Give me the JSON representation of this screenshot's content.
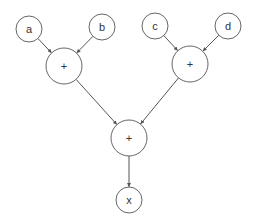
{
  "diagram": {
    "type": "computation-graph",
    "nodes": [
      {
        "id": "a",
        "label": "a",
        "cx": 29,
        "cy": 29,
        "r": 13
      },
      {
        "id": "b",
        "label": "b",
        "cx": 102,
        "cy": 27,
        "r": 13
      },
      {
        "id": "c",
        "label": "c",
        "cx": 155,
        "cy": 26,
        "r": 13
      },
      {
        "id": "d",
        "label": "d",
        "cx": 228,
        "cy": 26,
        "r": 13
      },
      {
        "id": "plus1",
        "label": "+",
        "cx": 64,
        "cy": 66,
        "r": 18
      },
      {
        "id": "plus2",
        "label": "+",
        "cx": 190,
        "cy": 64,
        "r": 18
      },
      {
        "id": "plus3",
        "label": "+",
        "cx": 129,
        "cy": 138,
        "r": 18
      },
      {
        "id": "x",
        "label": "x",
        "cx": 129,
        "cy": 200,
        "r": 13
      }
    ],
    "edges": [
      {
        "from": "a",
        "to": "plus1"
      },
      {
        "from": "b",
        "to": "plus1"
      },
      {
        "from": "c",
        "to": "plus2"
      },
      {
        "from": "d",
        "to": "plus2"
      },
      {
        "from": "plus1",
        "to": "plus3"
      },
      {
        "from": "plus2",
        "to": "plus3"
      },
      {
        "from": "plus3",
        "to": "x"
      }
    ]
  }
}
